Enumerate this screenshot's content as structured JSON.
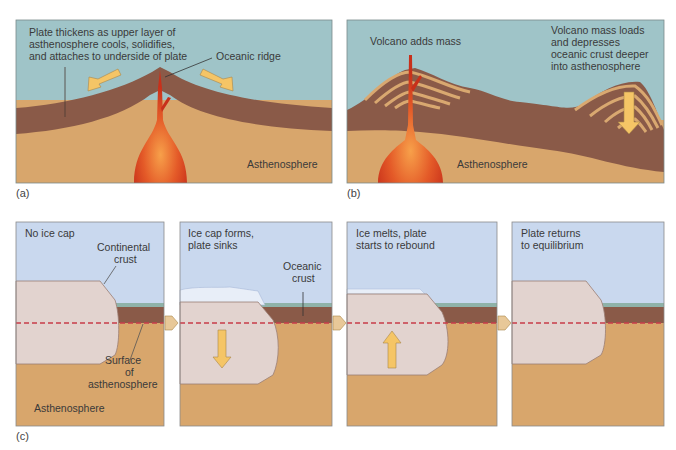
{
  "colors": {
    "sea_a": "#9fc4c8",
    "sea_b": "#9fc4c8",
    "sky_c": "#c9d8ee",
    "plate": "#8a5a48",
    "asthenosphere": "#d8a66c",
    "continent": "#e2d3cf",
    "magma_outer": "#c8361c",
    "magma_inner": "#f28a3a",
    "arrow": "#f5c566",
    "ice": "#e8eef8",
    "dashed_line": "#c83c4a",
    "thin_ocean_band": "#8fb2a8"
  },
  "panel_a": {
    "caption": "(a)",
    "labels": {
      "plate_line1": "Plate thickens as upper layer of",
      "plate_line2": "asthenosphere cools, solidifies,",
      "plate_line3": "and attaches to underside of plate",
      "ridge": "Oceanic ridge",
      "asthenosphere": "Asthenosphere"
    }
  },
  "panel_b": {
    "caption": "(b)",
    "labels": {
      "volcano": "Volcano adds mass",
      "loads_line1": "Volcano mass loads",
      "loads_line2": "and depresses",
      "loads_line3": "oceanic crust deeper",
      "loads_line4": "into asthenosphere",
      "asthenosphere": "Asthenosphere"
    }
  },
  "panel_c": {
    "caption": "(c)",
    "steps": [
      {
        "title_line1": "No ice cap",
        "title_line2": ""
      },
      {
        "title_line1": "Ice cap forms,",
        "title_line2": "plate sinks"
      },
      {
        "title_line1": "Ice melts, plate",
        "title_line2": "starts to rebound"
      },
      {
        "title_line1": "Plate returns",
        "title_line2": "to equilibrium"
      }
    ],
    "labels": {
      "continental_1": "Continental",
      "continental_2": "crust",
      "oceanic_1": "Oceanic",
      "oceanic_2": "crust",
      "surface_1": "Surface",
      "surface_2": "of",
      "surface_3": "asthenosphere",
      "asthenosphere": "Asthenosphere"
    }
  }
}
